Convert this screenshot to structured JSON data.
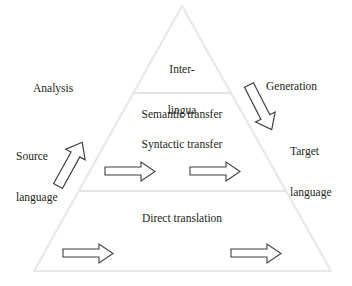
{
  "figure": {
    "name": "vauquois-triangle",
    "colors": {
      "triangle_stroke": "#e8e8e8",
      "divider_stroke": "#e4e4e4",
      "arrow_stroke": "#3a3a3a",
      "arrow_fill": "#ffffff",
      "text": "#231f20",
      "background": "#ffffff"
    },
    "levels": [
      {
        "id": "interlingua",
        "label": "Inter-\nlingua"
      },
      {
        "id": "transfer",
        "labels": [
          "Semantic transfer",
          "Syntactic transfer"
        ]
      },
      {
        "id": "direct",
        "label": "Direct translation"
      }
    ]
  },
  "labels": {
    "interlingua_line1": "Inter-",
    "interlingua_line2": "lingua",
    "semantic_transfer": "Semantic transfer",
    "syntactic_transfer": "Syntactic transfer",
    "direct_translation": "Direct translation",
    "analysis": "Analysis",
    "source_language_line1": "Source",
    "source_language_line2": "language",
    "generation": "Generation",
    "target_language_line1": "Target",
    "target_language_line2": "language"
  },
  "arrows": {
    "analysis_arrow": {
      "name": "analysis-arrow",
      "direction": "up-right",
      "style": "outlined-block-arrow"
    },
    "generation_arrow": {
      "name": "generation-arrow",
      "direction": "down-right",
      "style": "outlined-block-arrow"
    },
    "transfer_arrow_left": {
      "name": "transfer-arrow-left",
      "direction": "right",
      "style": "outlined-block-arrow"
    },
    "transfer_arrow_right": {
      "name": "transfer-arrow-right",
      "direction": "right",
      "style": "outlined-block-arrow"
    },
    "direct_arrow_left": {
      "name": "direct-arrow-left",
      "direction": "right",
      "style": "outlined-block-arrow"
    },
    "direct_arrow_right": {
      "name": "direct-arrow-right",
      "direction": "right",
      "style": "outlined-block-arrow"
    }
  }
}
